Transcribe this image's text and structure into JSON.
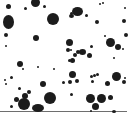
{
  "image": {
    "description": "Scattered dark particles on white background with a horizontal baseline",
    "background": "#ffffff",
    "dot_color": "#1c1c1c",
    "line_color": "#6e6e6e",
    "baseline": {
      "y": 111,
      "x_start": 0,
      "x_end": 127
    },
    "dots": [
      [
        8,
        6,
        2.5,
        2.5
      ],
      [
        35,
        2,
        4.5,
        4.5
      ],
      [
        25,
        8,
        1.5,
        1.5
      ],
      [
        44,
        6,
        1.5,
        1.5
      ],
      [
        8,
        22,
        5.5,
        7
      ],
      [
        6,
        35,
        2,
        2
      ],
      [
        36,
        38,
        3,
        3
      ],
      [
        6,
        46,
        1,
        1
      ],
      [
        20,
        64,
        3,
        3
      ],
      [
        38,
        67,
        1,
        1
      ],
      [
        53,
        19,
        6,
        6
      ],
      [
        71,
        13,
        1.5,
        1.5
      ],
      [
        77,
        11,
        5.5,
        4.5
      ],
      [
        71,
        16,
        2.5,
        2
      ],
      [
        86,
        15,
        1.5,
        1.5
      ],
      [
        100,
        4,
        1,
        1
      ],
      [
        105,
        36,
        1,
        1
      ],
      [
        97,
        22,
        2,
        2
      ],
      [
        103,
        3,
        1.2,
        1.2
      ],
      [
        125,
        8,
        1.2,
        1.2
      ],
      [
        124,
        21,
        2,
        2
      ],
      [
        126,
        35,
        2,
        2
      ],
      [
        69,
        42,
        3.5,
        3.5
      ],
      [
        68,
        50,
        2,
        2
      ],
      [
        110,
        42,
        4.5,
        4.5
      ],
      [
        118,
        47,
        3,
        3
      ],
      [
        123,
        49,
        1,
        1
      ],
      [
        91,
        46,
        1.5,
        1.5
      ],
      [
        89,
        55,
        2.5,
        2.5
      ],
      [
        82,
        52,
        3.5,
        3
      ],
      [
        78,
        52,
        2,
        2
      ],
      [
        71,
        50,
        1,
        1
      ],
      [
        75,
        55,
        2,
        2
      ],
      [
        72,
        60,
        2.5,
        2.5
      ],
      [
        114,
        58,
        1,
        1
      ],
      [
        69,
        60,
        1.5,
        1.5
      ],
      [
        23,
        69,
        1,
        1
      ],
      [
        11,
        77,
        1.5,
        1.5
      ],
      [
        5,
        80,
        1,
        1
      ],
      [
        6,
        84,
        1,
        1
      ],
      [
        43,
        84,
        3,
        3
      ],
      [
        19,
        88,
        1.5,
        1.5
      ],
      [
        29,
        92,
        2,
        2
      ],
      [
        16,
        99,
        2.5,
        2.5
      ],
      [
        25,
        96,
        3,
        3
      ],
      [
        24,
        104,
        6,
        6
      ],
      [
        11,
        106,
        1.5,
        1.5
      ],
      [
        38,
        108,
        6,
        4
      ],
      [
        50,
        98,
        6,
        6
      ],
      [
        72,
        74,
        3.5,
        3.5
      ],
      [
        91,
        76,
        1.5,
        1.5
      ],
      [
        94,
        75,
        1.5,
        1.5
      ],
      [
        97,
        74,
        1.5,
        1.5
      ],
      [
        116,
        76,
        4.5,
        4.5
      ],
      [
        70,
        82,
        2,
        2
      ],
      [
        77,
        81,
        2,
        2
      ],
      [
        92,
        81,
        1.5,
        1.5
      ],
      [
        107,
        83,
        2.5,
        2.5
      ],
      [
        124,
        82,
        2,
        2
      ],
      [
        71,
        94,
        1.5,
        1.5
      ],
      [
        90,
        98,
        4.5,
        4.5
      ],
      [
        101,
        98,
        4.5,
        4.5
      ],
      [
        110,
        97,
        2.5,
        2.5
      ],
      [
        95,
        106,
        3.5,
        3.5
      ],
      [
        114,
        111,
        2,
        1.5
      ],
      [
        91,
        111,
        1,
        1
      ],
      [
        125,
        78,
        1,
        1
      ],
      [
        54,
        69,
        1,
        1
      ],
      [
        63,
        82,
        1.5,
        1.5
      ]
    ]
  }
}
